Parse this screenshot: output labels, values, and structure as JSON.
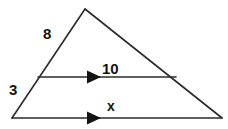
{
  "figure": {
    "type": "geometry-diagram",
    "background_color": "#ffffff",
    "stroke_color": "#2b2b2b",
    "label_color": "#141414"
  },
  "labels": {
    "left_upper_side": "8",
    "left_lower_side": "3",
    "midsegment": "10",
    "base": "x"
  },
  "vertices": {
    "apex": {
      "x": 85,
      "y": 9
    },
    "bottom_left": {
      "x": 12,
      "y": 118
    },
    "bottom_right": {
      "x": 222,
      "y": 118
    }
  },
  "segments": {
    "parallel_line": {
      "x1": 38,
      "y1": 77,
      "x2": 176,
      "y2": 77
    },
    "base_line": {
      "x1": 12,
      "y1": 118,
      "x2": 222,
      "y2": 118
    }
  },
  "arrow_markers": {
    "midsegment_arrow": {
      "x": 88,
      "y": 77
    },
    "base_arrow": {
      "x": 88,
      "y": 118
    }
  }
}
